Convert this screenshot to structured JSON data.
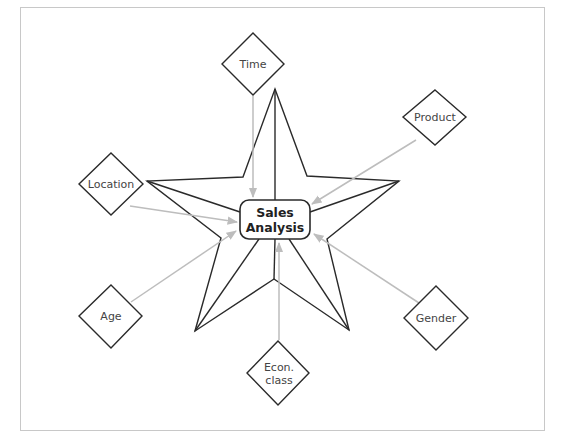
{
  "diagram": {
    "center": {
      "line1": "Sales",
      "line2": "Analysis"
    },
    "dimensions": [
      {
        "id": "time",
        "label": "Time"
      },
      {
        "id": "product",
        "label": "Product"
      },
      {
        "id": "location",
        "label": "Location"
      },
      {
        "id": "age",
        "label": "Age"
      },
      {
        "id": "gender",
        "label": "Gender"
      },
      {
        "id": "econ",
        "line1": "Econ.",
        "line2": "class"
      }
    ],
    "colors": {
      "outline": "#2a2a2a",
      "arrow": "#bdbdbd",
      "frame": "#c8c8c8"
    }
  }
}
